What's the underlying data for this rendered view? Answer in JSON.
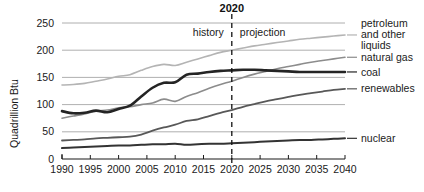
{
  "chart_data": {
    "type": "line",
    "title": "",
    "xlabel": "",
    "ylabel": "Quadrillion Btu",
    "xlim": [
      1990,
      2040
    ],
    "ylim": [
      0,
      250
    ],
    "grid": true,
    "legend_position": "right-inline",
    "x_ticks": [
      "1990",
      "1995",
      "2000",
      "2005",
      "2010",
      "2015",
      "2020",
      "2025",
      "2030",
      "2035",
      "2040"
    ],
    "y_ticks": [
      "0",
      "50",
      "100",
      "150",
      "200",
      "250"
    ],
    "annotations": {
      "divider_year": "2020",
      "history_label": "history",
      "projection_label": "projection"
    },
    "x": [
      1990,
      1992,
      1994,
      1996,
      1998,
      2000,
      2002,
      2004,
      2006,
      2008,
      2010,
      2012,
      2014,
      2016,
      2018,
      2020,
      2022,
      2024,
      2026,
      2028,
      2030,
      2032,
      2034,
      2036,
      2038,
      2040
    ],
    "series": [
      {
        "name": "petroleum and other liquids",
        "label": "petroleum and other liquids",
        "color": "#b4b4b4",
        "width": 1.6,
        "values": [
          136,
          137,
          139,
          143,
          147,
          152,
          155,
          163,
          170,
          174,
          172,
          178,
          184,
          190,
          196,
          200,
          204,
          208,
          211,
          214,
          217,
          220,
          222,
          224,
          226,
          228
        ]
      },
      {
        "name": "natural gas",
        "label": "natural gas",
        "color": "#8c8c8c",
        "width": 1.6,
        "values": [
          75,
          79,
          83,
          88,
          90,
          94,
          96,
          100,
          103,
          110,
          106,
          115,
          122,
          130,
          137,
          143,
          150,
          156,
          161,
          166,
          170,
          174,
          178,
          181,
          184,
          187
        ]
      },
      {
        "name": "coal",
        "label": "coal",
        "color": "#242424",
        "width": 2.6,
        "values": [
          88,
          84,
          85,
          89,
          86,
          92,
          98,
          115,
          131,
          140,
          141,
          155,
          157,
          160,
          162,
          163,
          164,
          164,
          163,
          162,
          161,
          160,
          160,
          160,
          160,
          160
        ]
      },
      {
        "name": "renewables",
        "label": "renewables",
        "color": "#585858",
        "width": 1.8,
        "values": [
          34,
          35,
          36,
          38,
          39,
          40,
          41,
          45,
          52,
          58,
          63,
          70,
          73,
          79,
          85,
          90,
          96,
          101,
          106,
          110,
          114,
          118,
          121,
          124,
          127,
          129
        ]
      },
      {
        "name": "nuclear",
        "label": "nuclear",
        "color": "#333333",
        "width": 2.0,
        "values": [
          20,
          21,
          22,
          23,
          24,
          25,
          25,
          26,
          27,
          27,
          28,
          26,
          27,
          28,
          28,
          29,
          30,
          31,
          32,
          33,
          34,
          35,
          35,
          36,
          37,
          38
        ]
      }
    ],
    "legend_entries": [
      {
        "label": "petroleum",
        "label2": "and other",
        "label3": "liquids"
      },
      {
        "label": "natural gas"
      },
      {
        "label": "coal"
      },
      {
        "label": "renewables"
      },
      {
        "label": "nuclear"
      }
    ]
  }
}
